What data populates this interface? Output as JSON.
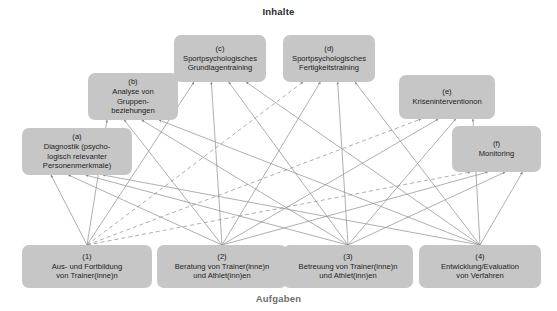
{
  "figure": {
    "top_axis_label": "Inhalte",
    "bottom_axis_label": "Aufgaben",
    "box_fill": "#c6c6c6",
    "line_color": "#8d8d8d",
    "text_color": "#1d1d1d"
  },
  "contents": [
    {
      "id": "a",
      "tag": "(a)",
      "label": "Diagnostik (psycho-\nlogisch relevanter\nPersonenmerkmale)",
      "x": 22,
      "y": 128,
      "w": 110,
      "h": 47
    },
    {
      "id": "b",
      "tag": "(b)",
      "label": "Analyse von\nGruppen-\nbeziehungen",
      "x": 88,
      "y": 73,
      "w": 90,
      "h": 47
    },
    {
      "id": "c",
      "tag": "(c)",
      "label": "Sportpsychologisches\nGrundlagentraining",
      "x": 174,
      "y": 35,
      "w": 92,
      "h": 47
    },
    {
      "id": "d",
      "tag": "(d)",
      "label": "Sportpsychologisches\nFertigkeitstraining",
      "x": 283,
      "y": 35,
      "w": 92,
      "h": 47
    },
    {
      "id": "e",
      "tag": "(e)",
      "label": "Kriseninterventionon",
      "x": 399,
      "y": 75,
      "w": 96,
      "h": 44
    },
    {
      "id": "f",
      "tag": "(f)",
      "label": "Monitoring",
      "x": 452,
      "y": 126,
      "w": 89,
      "h": 46
    }
  ],
  "tasks": [
    {
      "id": "1",
      "tag": "(1)",
      "label": "Aus- und Fortbildung\nvon Trainer(inne)n",
      "x": 22,
      "y": 245,
      "w": 130,
      "h": 43
    },
    {
      "id": "2",
      "tag": "(2)",
      "label": "Beratung von Trainer(inne)n\nund Athlet(inn)en",
      "x": 157,
      "y": 245,
      "w": 130,
      "h": 43
    },
    {
      "id": "3",
      "tag": "(3)",
      "label": "Betreuung von Trainer(inne)n\nund Athlet(inn)en",
      "x": 283,
      "y": 245,
      "w": 130,
      "h": 43
    },
    {
      "id": "4",
      "tag": "(4)",
      "label": "Entwicklung/Evaluation\nvon Verfahren",
      "x": 419,
      "y": 245,
      "w": 122,
      "h": 43
    }
  ],
  "edges": [
    {
      "from": "1",
      "to": "a",
      "style": "solid"
    },
    {
      "from": "1",
      "to": "b",
      "style": "solid"
    },
    {
      "from": "1",
      "to": "c",
      "style": "solid"
    },
    {
      "from": "1",
      "to": "d",
      "style": "dashed"
    },
    {
      "from": "1",
      "to": "e",
      "style": "dashed"
    },
    {
      "from": "1",
      "to": "f",
      "style": "dashed"
    },
    {
      "from": "2",
      "to": "a",
      "style": "solid"
    },
    {
      "from": "2",
      "to": "b",
      "style": "solid"
    },
    {
      "from": "2",
      "to": "c",
      "style": "solid"
    },
    {
      "from": "2",
      "to": "d",
      "style": "solid"
    },
    {
      "from": "2",
      "to": "e",
      "style": "solid"
    },
    {
      "from": "2",
      "to": "f",
      "style": "solid"
    },
    {
      "from": "3",
      "to": "a",
      "style": "solid"
    },
    {
      "from": "3",
      "to": "b",
      "style": "solid"
    },
    {
      "from": "3",
      "to": "c",
      "style": "solid"
    },
    {
      "from": "3",
      "to": "d",
      "style": "solid"
    },
    {
      "from": "3",
      "to": "e",
      "style": "solid"
    },
    {
      "from": "3",
      "to": "f",
      "style": "solid"
    },
    {
      "from": "4",
      "to": "a",
      "style": "solid"
    },
    {
      "from": "4",
      "to": "b",
      "style": "solid"
    },
    {
      "from": "4",
      "to": "c",
      "style": "solid"
    },
    {
      "from": "4",
      "to": "d",
      "style": "solid"
    },
    {
      "from": "4",
      "to": "e",
      "style": "solid"
    },
    {
      "from": "4",
      "to": "f",
      "style": "solid"
    }
  ]
}
